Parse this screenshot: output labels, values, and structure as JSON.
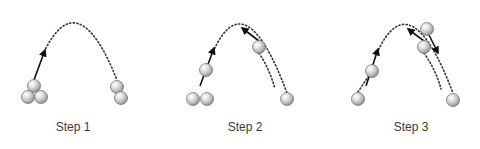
{
  "colors": {
    "background": "#ffffff",
    "trajectory": "#333333",
    "arrow": "#111111",
    "ball_highlight": "#ffffff",
    "ball_mid": "#c8c8c8",
    "ball_edge": "#7a7a7a",
    "label": "#3a3a3a"
  },
  "ball_radius": 6.5,
  "steps": [
    {
      "label": "Step 1",
      "label_pos": [
        73,
        131
      ],
      "trajectories": [
        {
          "name": "main-arc",
          "d": "M 44 52 Q 78 -18 117 80"
        }
      ],
      "arrows": [
        {
          "name": "throw-arrow",
          "from": [
            34,
            80
          ],
          "to": [
            45,
            50
          ]
        }
      ],
      "balls": [
        {
          "name": "left-hand-top-ball",
          "x": 34,
          "y": 86
        },
        {
          "name": "left-hand-bottom-left-ball",
          "x": 28,
          "y": 97
        },
        {
          "name": "left-hand-bottom-right-ball",
          "x": 41,
          "y": 97
        },
        {
          "name": "right-hand-top-ball",
          "x": 117,
          "y": 87
        },
        {
          "name": "right-hand-bottom-ball",
          "x": 121,
          "y": 98
        }
      ]
    },
    {
      "label": "Step 2",
      "label_pos": [
        245,
        131
      ],
      "trajectories": [
        {
          "name": "outer-arc",
          "d": "M 213 52 Q 245 -20 287 93"
        },
        {
          "name": "inner-arc",
          "d": "M 259 53 Q 270 70 275 89"
        }
      ],
      "arrows": [
        {
          "name": "throw-arrow-left",
          "from": [
            200,
            86
          ],
          "to": [
            214,
            48
          ]
        },
        {
          "name": "throw-arrow-right",
          "from": [
            259,
            41
          ],
          "to": [
            242,
            28
          ]
        }
      ],
      "balls": [
        {
          "name": "left-flying-ball",
          "x": 206,
          "y": 70
        },
        {
          "name": "left-hand-ball-1",
          "x": 193,
          "y": 99
        },
        {
          "name": "left-hand-ball-2",
          "x": 207,
          "y": 99
        },
        {
          "name": "right-flying-ball",
          "x": 259,
          "y": 47
        },
        {
          "name": "right-hand-ball",
          "x": 287,
          "y": 99
        }
      ]
    },
    {
      "label": "Step 3",
      "label_pos": [
        411,
        131
      ],
      "trajectories": [
        {
          "name": "outer-arc",
          "d": "M 358 92 L 372 71 M 377 53 Q 410 -20 453 93"
        },
        {
          "name": "inner-arc",
          "d": "M 424 53 Q 436 70 441 89"
        }
      ],
      "arrows": [
        {
          "name": "throw-arrow-left",
          "from": [
            366,
            86
          ],
          "to": [
            378,
            49
          ]
        },
        {
          "name": "throw-arrow-up-left",
          "from": [
            424,
            41
          ],
          "to": [
            408,
            29
          ]
        },
        {
          "name": "throw-arrow-down-right",
          "from": [
            429,
            35
          ],
          "to": [
            438,
            53
          ]
        }
      ],
      "balls": [
        {
          "name": "left-hand-ball",
          "x": 358,
          "y": 99
        },
        {
          "name": "left-flying-ball",
          "x": 372,
          "y": 71
        },
        {
          "name": "top-right-ball",
          "x": 427,
          "y": 29
        },
        {
          "name": "middle-right-ball",
          "x": 424,
          "y": 47
        },
        {
          "name": "right-hand-ball",
          "x": 453,
          "y": 100
        }
      ]
    }
  ]
}
